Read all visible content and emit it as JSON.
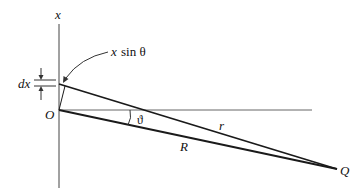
{
  "diagram": {
    "labels": {
      "x_axis": "x",
      "origin": "O",
      "dx": "dx",
      "path_diff_x": "x",
      "path_diff_sin": "sin θ",
      "angle": "ϑ",
      "r": "r",
      "R": "R",
      "Q": "Q"
    },
    "colors": {
      "line": "#1a1a1a",
      "axis": "#555555",
      "background": "#ffffff"
    }
  }
}
